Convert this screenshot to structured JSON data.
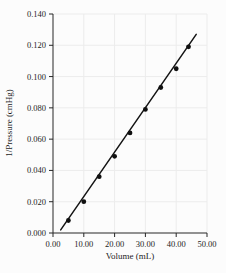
{
  "chart_data": {
    "type": "scatter",
    "title": "",
    "xlabel": "Volume (mL)",
    "ylabel": "1/Pressure (cmHg)",
    "xlim": [
      0,
      50
    ],
    "ylim": [
      0,
      0.14
    ],
    "grid": true,
    "legend_position": "none",
    "x": [
      5,
      10,
      15,
      20,
      25,
      30,
      35,
      40,
      44
    ],
    "y": [
      0.008,
      0.02,
      0.036,
      0.049,
      0.064,
      0.079,
      0.093,
      0.105,
      0.119
    ],
    "x_ticks": [
      0,
      10,
      20,
      30,
      40,
      50
    ],
    "x_tick_labels": [
      "0.00",
      "10.00",
      "20.00",
      "30.00",
      "40.00",
      "50.00"
    ],
    "y_ticks": [
      0,
      0.02,
      0.04,
      0.06,
      0.08,
      0.1,
      0.12,
      0.14
    ],
    "y_tick_labels": [
      "0.000",
      "0.020",
      "0.040",
      "0.060",
      "0.080",
      "0.100",
      "0.120",
      "0.140"
    ],
    "trendline": {
      "x1": 2.5,
      "y1": 0.002,
      "x2": 46.5,
      "y2": 0.127
    },
    "marker": "filled-circle",
    "colors": {
      "line": "#141414",
      "marker": "#101010",
      "grid": "#ececec",
      "axis": "#262626",
      "text": "#1c1c1c",
      "background": "#fcfcfc"
    }
  }
}
